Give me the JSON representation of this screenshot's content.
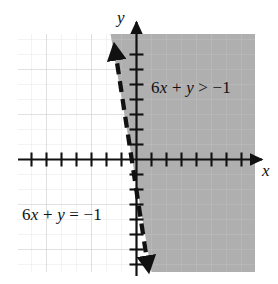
{
  "figure": {
    "kind": "coordinate-plane-inequality-graph",
    "axis_labels": {
      "x": "x",
      "y": "y"
    },
    "labels": {
      "inequality": "6x + y > −1",
      "boundary_line": "6x + y = −1"
    },
    "colors": {
      "shade_fill": "#a8a8a8",
      "grid_line": "#d8d8d8",
      "axis": "#111111",
      "boundary": "#111111",
      "background": "#ffffff"
    }
  },
  "chart_data": {
    "type": "line",
    "title": "",
    "subtitle": "",
    "xlabel": "x",
    "ylabel": "y",
    "grid": true,
    "legend_position": "inline-annotations",
    "xlim": [
      -8,
      8
    ],
    "ylim": [
      -8,
      8
    ],
    "xticks": [
      -7,
      -6,
      -5,
      -4,
      -3,
      -2,
      -1,
      1,
      2,
      3,
      4,
      5,
      6,
      7
    ],
    "yticks": [
      -7,
      -6,
      -5,
      -4,
      -3,
      -2,
      -1,
      1,
      2,
      3,
      4,
      5,
      6,
      7
    ],
    "tick_labels_shown": false,
    "series": [
      {
        "name": "6x + y = −1",
        "type": "boundary-line",
        "style": "dashed",
        "equation": "y = -6x - 1",
        "slope": -6,
        "intercept": -1,
        "points": [
          {
            "x": -1.1667,
            "y": 6.0
          },
          {
            "x": 1.1667,
            "y": -8.0
          }
        ],
        "arrows": [
          "start",
          "end"
        ]
      }
    ],
    "shaded_region": {
      "name": "6x + y > −1",
      "inequality": "6x + y > -1",
      "side": "right-of-line",
      "fill": "#a8a8a8",
      "boundary_included": false
    },
    "annotations": [
      {
        "text": "6x + y > −1",
        "x": 2.6,
        "y": 4.5
      },
      {
        "text": "6x + y = −1",
        "x": -6.2,
        "y": -4.1
      }
    ]
  }
}
